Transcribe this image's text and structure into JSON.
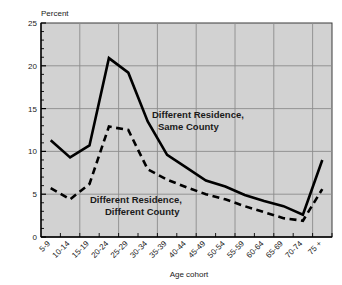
{
  "chart_data": {
    "type": "line",
    "title": "",
    "ylabel": "Percent",
    "xlabel": "Age cohort",
    "ylim": [
      0,
      25
    ],
    "yticks": [
      0,
      5,
      10,
      15,
      20,
      25
    ],
    "ytick_labels": [
      "0",
      "5",
      "10",
      "15",
      "20",
      "25"
    ],
    "grid": true,
    "legend_position": "inline-annotations",
    "categories": [
      "5-9",
      "10-14",
      "15-19",
      "20-24",
      "25-29",
      "30-34",
      "35-39",
      "40-44",
      "45-49",
      "50-54",
      "55-59",
      "60-64",
      "65-69",
      "70-74",
      "75 +"
    ],
    "series": [
      {
        "name": "Different Residence, Same County",
        "style": "solid",
        "color": "#000000",
        "values": [
          11.3,
          9.3,
          10.7,
          20.9,
          19.2,
          13.5,
          9.6,
          8.1,
          6.6,
          5.9,
          4.9,
          4.2,
          3.6,
          2.6,
          9.0
        ]
      },
      {
        "name": "Different Residence, Different County",
        "style": "dashed",
        "color": "#000000",
        "values": [
          5.7,
          4.4,
          6.2,
          12.9,
          12.5,
          7.9,
          6.7,
          5.8,
          5.0,
          4.4,
          3.6,
          2.9,
          2.2,
          1.9,
          5.6
        ]
      }
    ],
    "annotations": [
      {
        "id": "same-county",
        "line1": "Different Residence,",
        "line2": "Same County",
        "x": 152,
        "y": 118
      },
      {
        "id": "different-county",
        "line1": "Different Residence,",
        "line2": "Different County",
        "x": 90,
        "y": 203
      }
    ],
    "colors": {
      "plot_background": "#d2d2d2",
      "grid": "#8c8c8c",
      "axis": "#000000",
      "text": "#1a1a1a",
      "page_background": "#ffffff"
    }
  }
}
